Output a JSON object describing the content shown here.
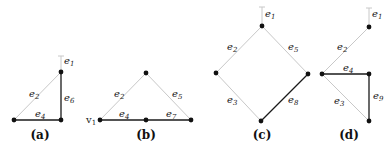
{
  "colors": {
    "dark_edge": "#1a1a1a",
    "light_edge": "#c8c8c8",
    "node": "#111111"
  },
  "panels": [
    {
      "caption": "(a)",
      "edges": [
        {
          "label": "e",
          "sub": "1",
          "style": "light"
        },
        {
          "label": "e",
          "sub": "2",
          "style": "light"
        },
        {
          "label": "e",
          "sub": "4",
          "style": "dark"
        },
        {
          "label": "e",
          "sub": "6",
          "style": "dark"
        }
      ]
    },
    {
      "caption": "(b)",
      "vertex_label": {
        "label": "v",
        "sub": "1"
      },
      "edges": [
        {
          "label": "e",
          "sub": "2",
          "style": "light"
        },
        {
          "label": "e",
          "sub": "5",
          "style": "light"
        },
        {
          "label": "e",
          "sub": "4",
          "style": "dark"
        },
        {
          "label": "e",
          "sub": "7",
          "style": "dark"
        }
      ]
    },
    {
      "caption": "(c)",
      "edges": [
        {
          "label": "e",
          "sub": "1",
          "style": "light"
        },
        {
          "label": "e",
          "sub": "2",
          "style": "light"
        },
        {
          "label": "e",
          "sub": "5",
          "style": "light"
        },
        {
          "label": "e",
          "sub": "3",
          "style": "light"
        },
        {
          "label": "e",
          "sub": "8",
          "style": "dark"
        }
      ]
    },
    {
      "caption": "(d)",
      "edges": [
        {
          "label": "e",
          "sub": "1",
          "style": "light"
        },
        {
          "label": "e",
          "sub": "2",
          "style": "light"
        },
        {
          "label": "e",
          "sub": "4",
          "style": "dark"
        },
        {
          "label": "e",
          "sub": "3",
          "style": "light"
        },
        {
          "label": "e",
          "sub": "9",
          "style": "dark"
        }
      ]
    }
  ]
}
